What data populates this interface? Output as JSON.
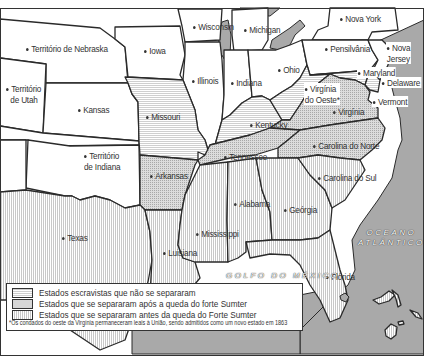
{
  "map": {
    "title": "",
    "colors": {
      "union": "#ffffff",
      "water": "#a9a9a9",
      "border": "#2a2a2a",
      "pattern_light": "#cfcfcf",
      "pattern_dotted": "#d6d6d6"
    },
    "labels": {
      "nebraska": "Território de Nebraska",
      "iowa": "Iowa",
      "wisconsin": "Wisconsin",
      "michigan": "Michigan",
      "nova_york": "Nova York",
      "utah_1": "Território",
      "utah_2": "de Utah",
      "kansas": "Kansas",
      "illinois": "Illinois",
      "indiana": "Indiana",
      "ohio": "Ohio",
      "pensilvania": "Pensilvânia",
      "nova_jersey_1": "Nova",
      "nova_jersey_2": "Jersey",
      "maryland": "Maryland",
      "delaware": "Delaware",
      "virginia_oeste_1": "Virgínia",
      "virginia_oeste_2": "do Oeste*",
      "virginia": "Virgínia",
      "vermont": "Vermont",
      "missouri": "Missouri",
      "kentucky": "Kentucky",
      "indiana_terr_1": "Território",
      "indiana_terr_2": "de Indiana",
      "arkansas": "Arkansas",
      "tennessee": "Tennessee",
      "carolina_norte": "Carolina do Norte",
      "carolina_sul": "Carolina do Sul",
      "texas": "Texas",
      "luisiana": "Luisiana",
      "mississippi": "Mississippi",
      "alabama": "Alabama",
      "georgia": "Geórgia",
      "florida": "Flórida",
      "oceano_1": "OCEANO",
      "oceano_2": "ATLÂNTICO",
      "golfo": "GOLFO DO MÉXICO"
    },
    "legend": [
      {
        "pattern": "horizontal-lines",
        "label": "Estados escravistas que não se separaram"
      },
      {
        "pattern": "dotted",
        "label": "Estados que se separaram após a queda do forte Sumter"
      },
      {
        "pattern": "vertical-lines",
        "label": "Estados que se separaram antes da queda do Forte Sumter"
      }
    ],
    "footnote": "*Os condados do oeste da Virgínia permaneceram leais à União, sendo admitidos como um novo estado em 1863"
  }
}
